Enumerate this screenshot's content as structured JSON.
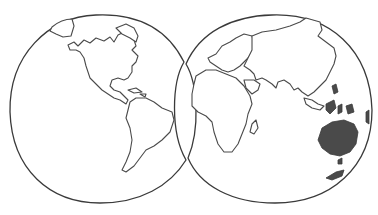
{
  "illustration": {
    "type": "hand-drawn world map, two hemispheres",
    "colors": {
      "background": "#ffffff",
      "line": "#3a3a3a",
      "shaded": "#4a4a4a"
    },
    "hemispheres": [
      {
        "name": "western-hemisphere",
        "regions": [
          "Greenland",
          "North America",
          "Caribbean",
          "South America"
        ]
      },
      {
        "name": "eastern-hemisphere",
        "regions": [
          "Europe",
          "Asia",
          "Africa",
          "Madagascar",
          "Indonesia",
          "Australia (shaded)",
          "New Zealand (shaded)"
        ]
      }
    ]
  }
}
